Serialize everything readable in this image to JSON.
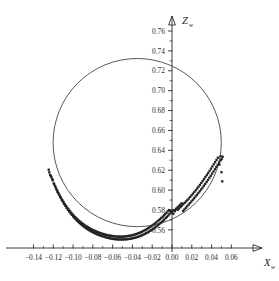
{
  "chart_data": {
    "type": "scatter",
    "title": "",
    "subtitle": "",
    "xlabel": "X",
    "xlabel_sub": "w",
    "ylabel": "Z",
    "ylabel_sub": "w",
    "grid": false,
    "legend": "none",
    "xlim": [
      -0.152,
      0.068
    ],
    "ylim": [
      0.5555,
      0.7705
    ],
    "xticks": [
      -0.14,
      -0.12,
      -0.1,
      -0.08,
      -0.06,
      -0.04,
      -0.02,
      0.0,
      0.02,
      0.04,
      0.06
    ],
    "xtick_labels": [
      "-0.14",
      "-0.12",
      "-0.10",
      "-0.08",
      "-0.06",
      "-0.04",
      "-0.02",
      "0.00",
      "0.02",
      "0.04",
      "0.06"
    ],
    "yticks": [
      0.56,
      0.58,
      0.6,
      0.62,
      0.64,
      0.66,
      0.68,
      0.7,
      0.72,
      0.74,
      0.76
    ],
    "ytick_labels": [
      "0.56",
      "0.58",
      "0.60",
      "0.62",
      "0.64",
      "0.66",
      "0.68",
      "0.70",
      "0.72",
      "0.74",
      "0.76"
    ],
    "minor_ticks_per_interval": 1,
    "axis_style": "arrowed-cross",
    "point_color": "#232323",
    "curve_color": "#3a3a3a",
    "axis_color": "#2b2b2b",
    "point_marker": "square",
    "point_size_px": 2.3,
    "series": [
      {
        "name": "fitted circle",
        "type": "circle",
        "center_x": -0.0352,
        "center_z": 0.6478,
        "radius": 0.085
      },
      {
        "name": "measured points",
        "type": "scatter",
        "x": [
          -0.1246,
          -0.1232,
          -0.1218,
          -0.1241,
          -0.1205,
          -0.1224,
          -0.1196,
          -0.121,
          -0.1182,
          -0.1169,
          -0.119,
          -0.1158,
          -0.1175,
          -0.1143,
          -0.1161,
          -0.113,
          -0.1148,
          -0.1117,
          -0.1135,
          -0.1104,
          -0.1122,
          -0.1092,
          -0.1109,
          -0.1078,
          -0.1096,
          -0.1066,
          -0.1083,
          -0.1052,
          -0.107,
          -0.104,
          -0.1057,
          -0.1026,
          -0.1044,
          -0.1014,
          -0.1031,
          -0.1,
          -0.1018,
          -0.0988,
          -0.1005,
          -0.0974,
          -0.0992,
          -0.0962,
          -0.0979,
          -0.0948,
          -0.0966,
          -0.0936,
          -0.0953,
          -0.0922,
          -0.094,
          -0.091,
          -0.0927,
          -0.0896,
          -0.0914,
          -0.0884,
          -0.0901,
          -0.087,
          -0.0888,
          -0.0858,
          -0.0875,
          -0.0844,
          -0.0862,
          -0.0832,
          -0.0849,
          -0.0818,
          -0.0836,
          -0.0806,
          -0.0823,
          -0.0792,
          -0.081,
          -0.078,
          -0.0797,
          -0.0766,
          -0.0784,
          -0.0754,
          -0.0771,
          -0.074,
          -0.0758,
          -0.0728,
          -0.0745,
          -0.0714,
          -0.0732,
          -0.0702,
          -0.0719,
          -0.0688,
          -0.0706,
          -0.0676,
          -0.0693,
          -0.0662,
          -0.068,
          -0.065,
          -0.0667,
          -0.0636,
          -0.0654,
          -0.0624,
          -0.0641,
          -0.061,
          -0.0628,
          -0.0598,
          -0.0615,
          -0.0584,
          -0.0602,
          -0.0572,
          -0.0589,
          -0.0558,
          -0.0576,
          -0.0546,
          -0.0563,
          -0.0532,
          -0.055,
          -0.052,
          -0.0537,
          -0.0506,
          -0.0524,
          -0.0494,
          -0.0511,
          -0.048,
          -0.0498,
          -0.0468,
          -0.0485,
          -0.0454,
          -0.0472,
          -0.0442,
          -0.0459,
          -0.0428,
          -0.0446,
          -0.0416,
          -0.0433,
          -0.0402,
          -0.042,
          -0.039,
          -0.0407,
          -0.0376,
          -0.0394,
          -0.0364,
          -0.0381,
          -0.035,
          -0.0368,
          -0.0338,
          -0.0355,
          -0.0324,
          -0.0342,
          -0.0312,
          -0.0329,
          -0.0298,
          -0.0316,
          -0.0286,
          -0.0303,
          -0.0272,
          -0.029,
          -0.026,
          -0.0277,
          -0.0246,
          -0.0264,
          -0.0234,
          -0.0251,
          -0.022,
          -0.0238,
          -0.0208,
          -0.0225,
          -0.0194,
          -0.0212,
          -0.0182,
          -0.0199,
          -0.0168,
          -0.0186,
          -0.0156,
          -0.0173,
          -0.0142,
          -0.016,
          -0.013,
          -0.0147,
          -0.0116,
          -0.0134,
          -0.0104,
          -0.0121,
          -0.009,
          -0.0108,
          -0.0078,
          -0.0095,
          -0.0064,
          -0.0082,
          -0.0052,
          -0.0069,
          -0.0038,
          -0.0056,
          -0.0026,
          -0.0043,
          -0.0012,
          -0.003,
          0.0,
          -0.0017,
          0.0014,
          0.0002,
          0.0028,
          0.0016,
          0.0042,
          0.003,
          0.0056,
          0.0044,
          0.007,
          0.0058,
          0.0084,
          0.0072,
          0.0098,
          0.0086,
          0.0112,
          0.01,
          0.0126,
          0.0114,
          0.014,
          0.0128,
          0.0154,
          0.0142,
          0.0168,
          0.0156,
          0.0182,
          0.017,
          0.0196,
          0.0184,
          0.021,
          0.0198,
          0.0224,
          0.0212,
          0.0238,
          0.0226,
          0.0252,
          0.024,
          0.0266,
          0.0254,
          0.028,
          0.0268,
          0.0294,
          0.0282,
          0.0308,
          0.0296,
          0.0322,
          0.031,
          0.0336,
          0.0324,
          0.035,
          0.0338,
          0.0364,
          0.0352,
          0.0378,
          0.0366,
          0.0392,
          0.038,
          0.0406,
          0.0394,
          0.042,
          0.0408,
          0.0434,
          0.0422,
          0.0448,
          0.0436,
          0.0462,
          0.045,
          0.0476,
          0.0464,
          0.049,
          0.0478,
          0.05,
          0.0492,
          0.0508,
          0.0502,
          0.0512
        ],
        "z": [
          0.6205,
          0.6152,
          0.6128,
          0.6178,
          0.6098,
          0.6142,
          0.6068,
          0.611,
          0.604,
          0.6008,
          0.6058,
          0.5982,
          0.6026,
          0.5956,
          0.5998,
          0.593,
          0.5972,
          0.5906,
          0.5946,
          0.5884,
          0.5924,
          0.5862,
          0.59,
          0.5842,
          0.588,
          0.5822,
          0.5858,
          0.5802,
          0.584,
          0.5786,
          0.582,
          0.5768,
          0.5804,
          0.5752,
          0.5788,
          0.5736,
          0.5772,
          0.5722,
          0.5756,
          0.5708,
          0.5742,
          0.5694,
          0.5728,
          0.5682,
          0.5716,
          0.567,
          0.5704,
          0.5658,
          0.5692,
          0.5648,
          0.5682,
          0.5636,
          0.567,
          0.5628,
          0.566,
          0.5618,
          0.5652,
          0.561,
          0.5642,
          0.56,
          0.5634,
          0.5594,
          0.5626,
          0.5586,
          0.5618,
          0.558,
          0.561,
          0.5572,
          0.5604,
          0.5566,
          0.5598,
          0.556,
          0.5592,
          0.5554,
          0.5586,
          0.555,
          0.558,
          0.5544,
          0.5576,
          0.554,
          0.557,
          0.5536,
          0.5566,
          0.5532,
          0.5562,
          0.5528,
          0.5558,
          0.5524,
          0.5554,
          0.552,
          0.555,
          0.5518,
          0.5548,
          0.5514,
          0.5544,
          0.5512,
          0.5542,
          0.551,
          0.554,
          0.5508,
          0.5538,
          0.5506,
          0.5536,
          0.5506,
          0.5534,
          0.5504,
          0.5534,
          0.5504,
          0.5532,
          0.5504,
          0.5532,
          0.5504,
          0.5532,
          0.5504,
          0.5532,
          0.5504,
          0.5532,
          0.5506,
          0.5534,
          0.5506,
          0.5534,
          0.5508,
          0.5536,
          0.551,
          0.5538,
          0.5512,
          0.554,
          0.5514,
          0.5542,
          0.5518,
          0.5546,
          0.552,
          0.5548,
          0.5524,
          0.5552,
          0.5528,
          0.5556,
          0.5532,
          0.556,
          0.5538,
          0.5566,
          0.5542,
          0.557,
          0.5548,
          0.5576,
          0.5554,
          0.5582,
          0.556,
          0.5588,
          0.5568,
          0.5596,
          0.5574,
          0.5602,
          0.5582,
          0.561,
          0.559,
          0.5618,
          0.5598,
          0.5626,
          0.5608,
          0.5636,
          0.5616,
          0.5644,
          0.5626,
          0.5654,
          0.5636,
          0.5664,
          0.5646,
          0.5674,
          0.5658,
          0.5686,
          0.5668,
          0.5696,
          0.568,
          0.5708,
          0.5692,
          0.572,
          0.5704,
          0.5732,
          0.5718,
          0.5746,
          0.573,
          0.5758,
          0.5744,
          0.5772,
          0.5758,
          0.5786,
          0.5772,
          0.58,
          0.5786,
          0.5792,
          0.5762,
          0.5776,
          0.5788,
          0.58,
          0.5812,
          0.5796,
          0.5826,
          0.581,
          0.584,
          0.5802,
          0.5854,
          0.5816,
          0.5868,
          0.583,
          0.579,
          0.5844,
          0.5806,
          0.5858,
          0.5822,
          0.5872,
          0.5838,
          0.5886,
          0.5854,
          0.59,
          0.587,
          0.5916,
          0.5886,
          0.5932,
          0.5902,
          0.5948,
          0.5918,
          0.5964,
          0.5936,
          0.5982,
          0.5952,
          0.5998,
          0.597,
          0.6016,
          0.5988,
          0.6034,
          0.6006,
          0.6052,
          0.6024,
          0.6072,
          0.6044,
          0.6092,
          0.6062,
          0.6112,
          0.6082,
          0.6132,
          0.6102,
          0.6152,
          0.6124,
          0.6172,
          0.6144,
          0.6194,
          0.6166,
          0.6216,
          0.6188,
          0.6238,
          0.621,
          0.626,
          0.6232,
          0.6282,
          0.6254,
          0.6304,
          0.6276,
          0.6326,
          0.6298,
          0.6256,
          0.618,
          0.634,
          0.6088,
          0.6312,
          0.6336
        ]
      }
    ]
  }
}
